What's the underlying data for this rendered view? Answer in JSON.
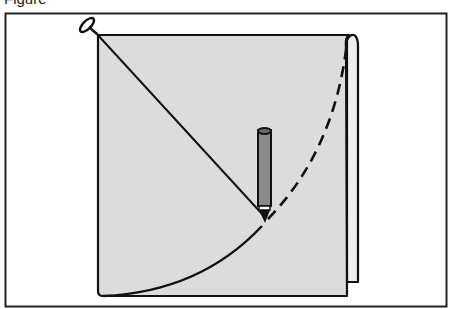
{
  "caption": {
    "text": "Figure"
  },
  "diagram": {
    "colors": {
      "paper_fill": "#dcdcdc",
      "back_flap_fill": "#eeeeee",
      "pencil_body": "#8a8a8a",
      "outline": "#111111",
      "frame": "#222222",
      "background": "#ffffff"
    },
    "elements": {
      "frame": "outer-border",
      "paper": "square-sheet",
      "back_flap": "curled-right-edge",
      "pin": "pushpin-at-top-left-corner",
      "string": "straight-line-from-pin-to-pencil-tip",
      "pencil": "vertical-pencil",
      "arc_drawn": "solid-arc-from-bottom-left-to-pencil",
      "arc_remaining": "dashed-arc-from-pencil-to-top-right"
    }
  }
}
